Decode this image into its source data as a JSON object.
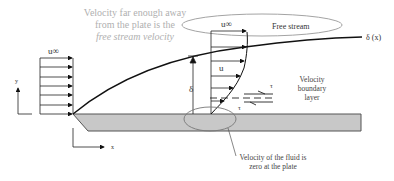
{
  "annotations": {
    "free_stream_note": {
      "line1": "Velocity far enough away",
      "line2": "from the plate is the",
      "line3": "free stream velocity"
    },
    "free_stream_label": "Free stream",
    "boundary_thickness_label": "δ (x)",
    "velocity_boundary_layer": {
      "line1": "Velocity",
      "line2": "boundary",
      "line3": "layer"
    },
    "no_slip_note": {
      "line1": "Velocity of the fluid is",
      "line2": "zero at the plate"
    }
  },
  "symbols": {
    "u_infinity_inlet": "u∞",
    "u_infinity_profile": "u∞",
    "u_local": "u",
    "delta": "δ",
    "tau_upper": "τ",
    "tau_lower": "τ",
    "axis_y": "y",
    "axis_x": "x"
  },
  "colors": {
    "plate_fill": "#c8c8c8",
    "plate_edge": "#555555",
    "ellipse_stroke": "#999999",
    "line": "#111111",
    "faded_text": "#b0b0b0"
  }
}
